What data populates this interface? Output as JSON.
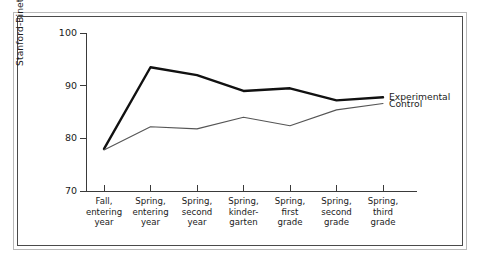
{
  "chart_data": {
    "type": "line",
    "title": "",
    "xlabel": "",
    "ylabel": "Stanford-Binet I.Q. score",
    "ylim": [
      70,
      100
    ],
    "yticks": [
      70,
      80,
      90,
      100
    ],
    "ytick_labels": [
      "70",
      "80",
      "90",
      "100"
    ],
    "grid": false,
    "legend_position": "right-inline-end-of-lines",
    "categories": [
      "Fall,\nentering\nyear",
      "Spring,\nentering\nyear",
      "Spring,\nsecond\nyear",
      "Spring,\nkinder-\ngarten",
      "Spring,\nfirst\ngrade",
      "Spring,\nsecond\ngrade",
      "Spring,\nthird\ngrade"
    ],
    "series": [
      {
        "name": "Experimental",
        "values": [
          78.0,
          93.5,
          92.0,
          89.0,
          89.5,
          87.2,
          87.8
        ],
        "color": "#111111",
        "line_width": 2.4
      },
      {
        "name": "Control",
        "values": [
          77.8,
          82.2,
          81.8,
          84.0,
          82.4,
          85.4,
          86.6
        ],
        "color": "#555555",
        "line_width": 1.1
      }
    ]
  },
  "legend": {
    "experimental": "Experimental",
    "control": "Control"
  },
  "axes": {
    "y_title": "Stanford-Binet I.Q. score",
    "y_tick_0": "70",
    "y_tick_1": "80",
    "y_tick_2": "90",
    "y_tick_3": "100"
  },
  "xlabels": {
    "c0": "Fall,\nentering\nyear",
    "c1": "Spring,\nentering\nyear",
    "c2": "Spring,\nsecond\nyear",
    "c3": "Spring,\nkinder-\ngarten",
    "c4": "Spring,\nfirst\ngrade",
    "c5": "Spring,\nsecond\ngrade",
    "c6": "Spring,\nthird\ngrade"
  }
}
